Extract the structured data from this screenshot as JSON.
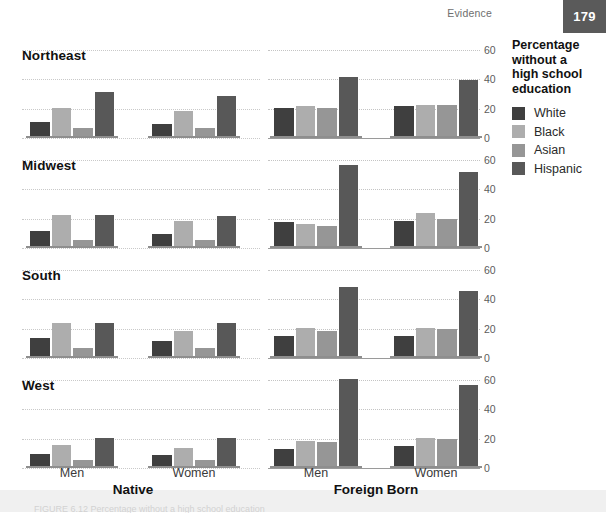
{
  "header": {
    "running_head": "Evidence",
    "page_number": "179"
  },
  "legend": {
    "title_lines": [
      "Percentage",
      "without a",
      "high school",
      "education"
    ],
    "title": "Percentage without a high school education",
    "items": [
      {
        "label": "White",
        "color": "#3f3f3f"
      },
      {
        "label": "Black",
        "color": "#adadad"
      },
      {
        "label": "Asian",
        "color": "#969696"
      },
      {
        "label": "Hispanic",
        "color": "#585858"
      }
    ]
  },
  "axis": {
    "ticks": [
      "60",
      "40",
      "20",
      "0"
    ],
    "tick_values": [
      60,
      40,
      20,
      0
    ]
  },
  "labels": {
    "sex": [
      "Men",
      "Women"
    ],
    "groups": [
      "Native",
      "Foreign Born"
    ],
    "regions": [
      "Northeast",
      "Midwest",
      "South",
      "West"
    ]
  },
  "caption": {
    "text": "FIGURE 6.12 Percentage without a high school education"
  },
  "chart_data": {
    "type": "bar",
    "title": "Percentage without a high school education",
    "subtitle": "",
    "xlabel": "",
    "ylabel": "Percentage without a high school education",
    "ylim": [
      0,
      60
    ],
    "yticks": [
      0,
      20,
      40,
      60
    ],
    "grid": true,
    "legend_position": "right",
    "series_names": [
      "White",
      "Black",
      "Asian",
      "Hispanic"
    ],
    "series_colors": [
      "#3f3f3f",
      "#adadad",
      "#969696",
      "#585858"
    ],
    "facet_rows": [
      "Northeast",
      "Midwest",
      "South",
      "West"
    ],
    "facet_cols": [
      "Native",
      "Foreign Born"
    ],
    "subgroups": [
      "Men",
      "Women"
    ],
    "panels": [
      {
        "region": "Northeast",
        "nativity": "Native",
        "sex": "Men",
        "categories": [
          "White",
          "Black",
          "Asian",
          "Hispanic"
        ],
        "values": [
          9,
          19,
          5,
          30
        ]
      },
      {
        "region": "Northeast",
        "nativity": "Native",
        "sex": "Women",
        "categories": [
          "White",
          "Black",
          "Asian",
          "Hispanic"
        ],
        "values": [
          8,
          17,
          5,
          27
        ]
      },
      {
        "region": "Northeast",
        "nativity": "Foreign Born",
        "sex": "Men",
        "categories": [
          "White",
          "Black",
          "Asian",
          "Hispanic"
        ],
        "values": [
          19,
          20,
          19,
          40
        ]
      },
      {
        "region": "Northeast",
        "nativity": "Foreign Born",
        "sex": "Women",
        "categories": [
          "White",
          "Black",
          "Asian",
          "Hispanic"
        ],
        "values": [
          20,
          21,
          21,
          38
        ]
      },
      {
        "region": "Midwest",
        "nativity": "Native",
        "sex": "Men",
        "categories": [
          "White",
          "Black",
          "Asian",
          "Hispanic"
        ],
        "values": [
          10,
          21,
          4,
          21
        ]
      },
      {
        "region": "Midwest",
        "nativity": "Native",
        "sex": "Women",
        "categories": [
          "White",
          "Black",
          "Asian",
          "Hispanic"
        ],
        "values": [
          8,
          17,
          4,
          20
        ]
      },
      {
        "region": "Midwest",
        "nativity": "Foreign Born",
        "sex": "Men",
        "categories": [
          "White",
          "Black",
          "Asian",
          "Hispanic"
        ],
        "values": [
          16,
          15,
          13,
          55
        ]
      },
      {
        "region": "Midwest",
        "nativity": "Foreign Born",
        "sex": "Women",
        "categories": [
          "White",
          "Black",
          "Asian",
          "Hispanic"
        ],
        "values": [
          17,
          22,
          18,
          50
        ]
      },
      {
        "region": "South",
        "nativity": "Native",
        "sex": "Men",
        "categories": [
          "White",
          "Black",
          "Asian",
          "Hispanic"
        ],
        "values": [
          12,
          22,
          5,
          22
        ]
      },
      {
        "region": "South",
        "nativity": "Native",
        "sex": "Women",
        "categories": [
          "White",
          "Black",
          "Asian",
          "Hispanic"
        ],
        "values": [
          10,
          17,
          5,
          22
        ]
      },
      {
        "region": "South",
        "nativity": "Foreign Born",
        "sex": "Men",
        "categories": [
          "White",
          "Black",
          "Asian",
          "Hispanic"
        ],
        "values": [
          13,
          19,
          17,
          47
        ]
      },
      {
        "region": "South",
        "nativity": "Foreign Born",
        "sex": "Women",
        "categories": [
          "White",
          "Black",
          "Asian",
          "Hispanic"
        ],
        "values": [
          13,
          19,
          18,
          44
        ]
      },
      {
        "region": "West",
        "nativity": "Native",
        "sex": "Men",
        "categories": [
          "White",
          "Black",
          "Asian",
          "Hispanic"
        ],
        "values": [
          8,
          14,
          4,
          19
        ]
      },
      {
        "region": "West",
        "nativity": "Native",
        "sex": "Women",
        "categories": [
          "White",
          "Black",
          "Asian",
          "Hispanic"
        ],
        "values": [
          7,
          12,
          4,
          19
        ]
      },
      {
        "region": "West",
        "nativity": "Foreign Born",
        "sex": "Men",
        "categories": [
          "White",
          "Black",
          "Asian",
          "Hispanic"
        ],
        "values": [
          11,
          17,
          16,
          59
        ]
      },
      {
        "region": "West",
        "nativity": "Foreign Born",
        "sex": "Women",
        "categories": [
          "White",
          "Black",
          "Asian",
          "Hispanic"
        ],
        "values": [
          13,
          19,
          18,
          55
        ]
      }
    ]
  }
}
